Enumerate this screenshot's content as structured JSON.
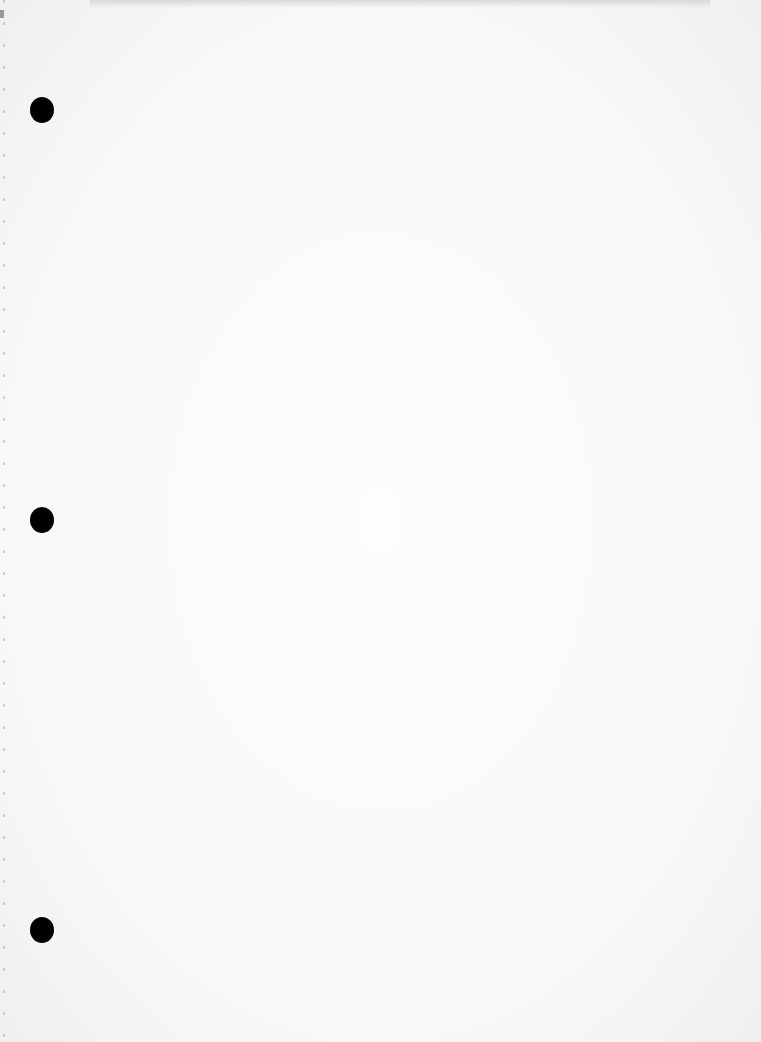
{
  "document": {
    "type": "blank hole-punched sheet",
    "text": "",
    "holes": [
      {
        "x": 30,
        "y": 97
      },
      {
        "x": 30,
        "y": 507
      },
      {
        "x": 30,
        "y": 917
      }
    ],
    "colors": {
      "paper": "#f8f8f8",
      "hole": "#000000"
    }
  }
}
